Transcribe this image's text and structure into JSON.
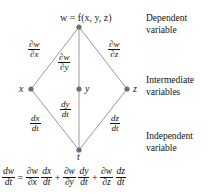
{
  "diagram": {
    "type": "tree-diagram",
    "nodes": {
      "dependent": {
        "label": "w = f(x, y, z)",
        "variable": "w"
      },
      "intermediate": [
        {
          "variable": "x"
        },
        {
          "variable": "y"
        },
        {
          "variable": "z"
        }
      ],
      "independent": {
        "variable": "t"
      }
    },
    "edge_labels": {
      "w_x": {
        "num": "∂w",
        "den": "∂x"
      },
      "w_y": {
        "num": "∂w",
        "den": "∂y"
      },
      "w_z": {
        "num": "∂w",
        "den": "∂z"
      },
      "x_t": {
        "num": "dx",
        "den": "dt"
      },
      "y_t": {
        "num": "dy",
        "den": "dt"
      },
      "z_t": {
        "num": "dz",
        "den": "dt"
      }
    },
    "captions": {
      "dependent_line1": "Dependent",
      "dependent_line2": "variable",
      "intermediate_line1": "Intermediate",
      "intermediate_line2": "variables",
      "independent_line1": "Independent",
      "independent_line2": "variable"
    },
    "equation": {
      "lhs": {
        "num": "dw",
        "den": "dt"
      },
      "equals": "=",
      "term1a": {
        "num": "∂w",
        "den": "∂x"
      },
      "term1b": {
        "num": "dx",
        "den": "dt"
      },
      "plus1": "+",
      "term2a": {
        "num": "∂w",
        "den": "∂y"
      },
      "term2b": {
        "num": "dy",
        "den": "dt"
      },
      "plus2": "+",
      "term3a": {
        "num": "∂w",
        "den": "∂z"
      },
      "term3b": {
        "num": "dz",
        "den": "dt"
      }
    },
    "colors": {
      "line": "#9a9a9a",
      "node": "#6e6e6e",
      "text": "#111111",
      "background": "#ffffff"
    }
  }
}
